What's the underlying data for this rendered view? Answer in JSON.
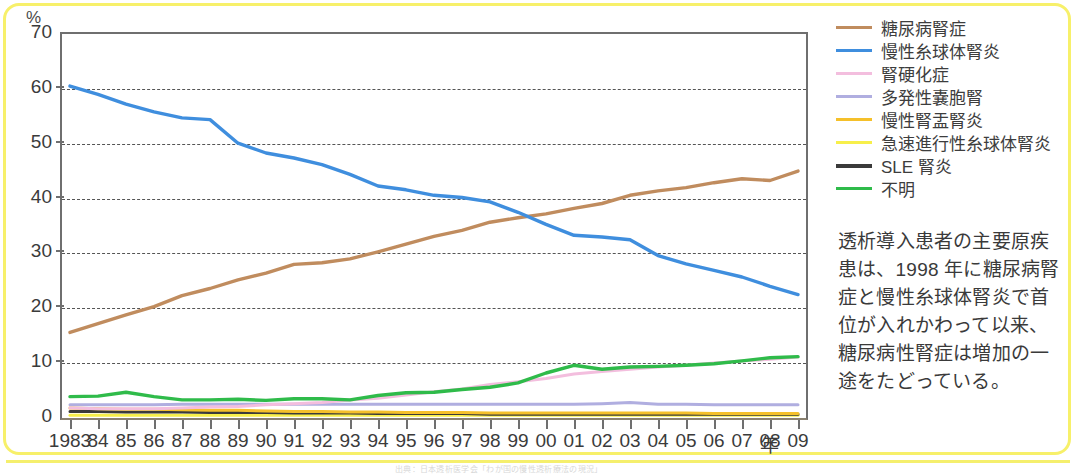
{
  "unit_label": "%",
  "x_axis_unit": "年",
  "caption": "透析導入患者の主要原疾患は、1998 年に糖尿病腎症と慢性糸球体腎炎で首位が入れかわって以来、糖尿病性腎症は増加の一途をたどっている。",
  "footer_ghost": "出典：日本透析医学会「わが国の慢性透析療法の現況」",
  "legend": [
    {
      "label": "糖尿病腎症",
      "color": "#c08c5e"
    },
    {
      "label": "慢性糸球体腎炎",
      "color": "#3f8ede"
    },
    {
      "label": "腎硬化症",
      "color": "#f3bede"
    },
    {
      "label": "多発性嚢胞腎",
      "color": "#b0aee0"
    },
    {
      "label": "慢性腎盂腎炎",
      "color": "#f5c02a"
    },
    {
      "label": "急速進行性糸球体腎炎",
      "color": "#f7ef4a"
    },
    {
      "label": "SLE 腎炎",
      "color": "#3a3a3a"
    },
    {
      "label": "不明",
      "color": "#2fbb4a"
    }
  ],
  "chart_data": {
    "type": "line",
    "title": "",
    "xlabel": "年",
    "ylabel": "%",
    "ylim": [
      0,
      70
    ],
    "yticks": [
      0,
      10,
      20,
      30,
      40,
      50,
      60,
      70
    ],
    "grid": true,
    "legend_position": "right",
    "x": [
      "1983",
      "84",
      "85",
      "86",
      "87",
      "88",
      "89",
      "90",
      "91",
      "92",
      "93",
      "94",
      "95",
      "96",
      "97",
      "98",
      "99",
      "00",
      "01",
      "02",
      "03",
      "04",
      "05",
      "06",
      "07",
      "08",
      "09"
    ],
    "series": [
      {
        "name": "糖尿病腎症",
        "color": "#c08c5e",
        "values": [
          15.6,
          17.2,
          18.8,
          20.3,
          22.3,
          23.6,
          25.2,
          26.4,
          28.0,
          28.3,
          29.0,
          30.3,
          31.7,
          33.1,
          34.2,
          35.7,
          36.5,
          37.2,
          38.2,
          39.1,
          40.6,
          41.4,
          42.0,
          42.9,
          43.6,
          43.3,
          45.0
        ]
      },
      {
        "name": "慢性糸球体腎炎",
        "color": "#3f8ede",
        "values": [
          60.5,
          59.0,
          57.2,
          55.8,
          54.7,
          54.4,
          50.1,
          48.3,
          47.4,
          46.2,
          44.4,
          42.3,
          41.6,
          40.6,
          40.2,
          39.4,
          37.5,
          35.3,
          33.3,
          33.0,
          32.5,
          29.6,
          28.1,
          26.9,
          25.7,
          24.0,
          22.5
        ]
      },
      {
        "name": "腎硬化症",
        "color": "#f3bede",
        "values": [
          1.8,
          1.7,
          1.7,
          1.7,
          1.8,
          2.0,
          2.1,
          2.4,
          2.6,
          2.8,
          3.3,
          3.6,
          4.2,
          4.8,
          5.3,
          6.1,
          6.6,
          7.2,
          8.0,
          8.5,
          8.9,
          9.3,
          9.6,
          10.0,
          10.4,
          10.7,
          11.1
        ]
      },
      {
        "name": "多発性嚢胞腎",
        "color": "#b0aee0",
        "values": [
          2.4,
          2.4,
          2.4,
          2.4,
          2.5,
          2.5,
          2.5,
          2.5,
          2.5,
          2.5,
          2.5,
          2.5,
          2.5,
          2.5,
          2.5,
          2.5,
          2.5,
          2.5,
          2.5,
          2.6,
          2.8,
          2.5,
          2.5,
          2.4,
          2.4,
          2.4,
          2.4
        ]
      },
      {
        "name": "慢性腎盂腎炎",
        "color": "#f5c02a",
        "values": [
          1.8,
          1.7,
          1.6,
          1.6,
          1.5,
          1.4,
          1.4,
          1.3,
          1.2,
          1.2,
          1.1,
          1.1,
          1.0,
          1.0,
          1.0,
          0.9,
          0.9,
          0.9,
          0.9,
          0.9,
          0.9,
          0.9,
          0.9,
          0.8,
          0.8,
          0.8,
          0.8
        ]
      },
      {
        "name": "急速進行性糸球体腎炎",
        "color": "#f7ef4a",
        "values": [
          0.5,
          0.5,
          0.5,
          0.5,
          0.5,
          0.5,
          0.5,
          0.5,
          0.5,
          0.5,
          0.5,
          0.5,
          0.5,
          0.5,
          0.5,
          0.5,
          0.5,
          0.5,
          0.5,
          0.5,
          0.5,
          0.5,
          0.5,
          0.5,
          0.5,
          0.5,
          0.5
        ]
      },
      {
        "name": "SLE 腎炎",
        "color": "#3a3a3a",
        "values": [
          1.2,
          1.2,
          1.1,
          1.1,
          1.1,
          1.0,
          1.0,
          1.0,
          0.9,
          0.9,
          0.9,
          0.8,
          0.8,
          0.8,
          0.8,
          0.7,
          0.7,
          0.7,
          0.7,
          0.7,
          0.7,
          0.7,
          0.7,
          0.7,
          0.7,
          0.7,
          0.7
        ]
      },
      {
        "name": "不明",
        "color": "#2fbb4a",
        "values": [
          3.9,
          4.0,
          4.7,
          3.9,
          3.3,
          3.3,
          3.4,
          3.2,
          3.5,
          3.5,
          3.3,
          4.1,
          4.6,
          4.7,
          5.2,
          5.6,
          6.4,
          8.2,
          9.6,
          8.9,
          9.3,
          9.4,
          9.6,
          9.9,
          10.4,
          11.0,
          11.2
        ]
      }
    ]
  }
}
